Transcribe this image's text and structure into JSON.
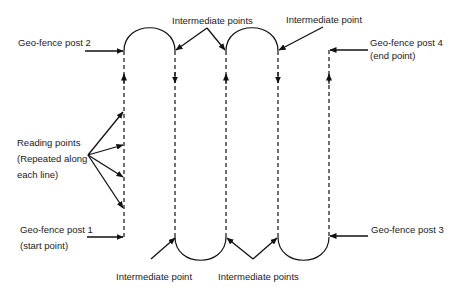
{
  "diagram": {
    "labels": {
      "post2": "Geo-fence post 2",
      "post4_line1": "Geo-fence post 4",
      "post4_line2": "(end point)",
      "post1_line1": "Geo-fence post 1",
      "post1_line2": "(start point)",
      "post3": "Geo-fence post 3",
      "reading_line1": "Reading points",
      "reading_line2": "(Repeated along",
      "reading_line3": "each line)",
      "top_intermediate_points": "Intermediate points",
      "top_intermediate_point": "Intermediate point",
      "bottom_intermediate_point": "Intermediate point",
      "bottom_intermediate_points": "Intermediate points"
    },
    "line_count": 5,
    "line_directions": [
      "up",
      "down",
      "up",
      "down",
      "up"
    ],
    "colors": {
      "stroke": "#111111",
      "background": "#ffffff"
    }
  }
}
